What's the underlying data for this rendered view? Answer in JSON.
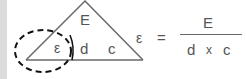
{
  "diagram": {
    "triangle": {
      "top_label": "E",
      "bottom_labels": [
        "ε",
        "d",
        "c"
      ]
    },
    "highlight": "dashed-ellipse-around-epsilon",
    "formula": {
      "lhs": "ε",
      "equals": "=",
      "numerator": "E",
      "denominator": [
        "d",
        "x",
        "c"
      ]
    },
    "colors": {
      "line": "#6a6a6a",
      "text": "#555555",
      "dashed": "#111111",
      "stripe": "#dcdcdc"
    }
  }
}
